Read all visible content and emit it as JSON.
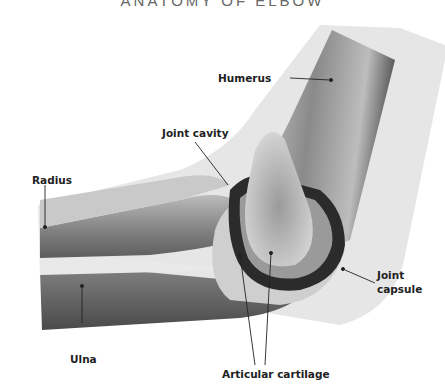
{
  "title": "ANATOMY OF ELBOW",
  "labels": {
    "humerus": "Humerus",
    "joint_cavity": "Joint cavity",
    "radius": "Radius",
    "ulna": "Ulna",
    "joint_capsule_line1": "Joint",
    "joint_capsule_line2": "capsule",
    "articular_cartilage": "Articular cartilage"
  },
  "colors": {
    "skin": "#e6e6e6",
    "bone_dark": "#6e6e6e",
    "bone_light": "#bdbdbd",
    "cavity": "#2b2b2b",
    "leader": "#222222"
  }
}
